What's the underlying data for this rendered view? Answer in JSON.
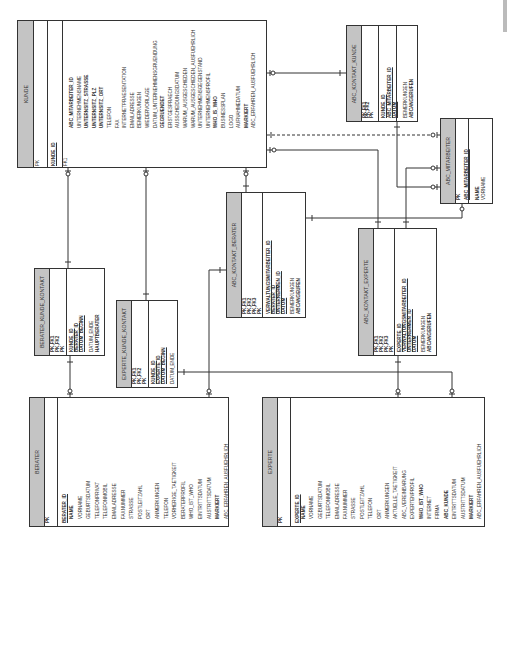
{
  "diagram": {
    "type": "entity-relationship",
    "orientation": "rotated-90-ccw"
  },
  "entities": {
    "kunde": {
      "name": "KUNDE",
      "keys": [
        "PK",
        "FK1"
      ],
      "pk": [
        "KUNDE_ID"
      ],
      "attributes": [
        {
          "label": "ABC_MITARBEITER_ID",
          "bold": true
        },
        {
          "label": "UNTERNEHMENSNAME",
          "bold": false
        },
        {
          "label": "UNTERNSITZ_STRASSE",
          "bold": true
        },
        {
          "label": "UNTERNSITZ_PLZ",
          "bold": true
        },
        {
          "label": "UNTERNSITZ_ORT",
          "bold": true
        },
        {
          "label": "TELEFON",
          "bold": false
        },
        {
          "label": "FAX",
          "bold": false
        },
        {
          "label": "INTERNETPRAESENTATION",
          "bold": false
        },
        {
          "label": "EMAILADRESSE",
          "bold": false
        },
        {
          "label": "BEMERKUNGEN",
          "bold": false
        },
        {
          "label": "WIEDERVORLAGE",
          "bold": false
        },
        {
          "label": "DATUM_UNTERNEHMENSGRUENDUNG",
          "bold": false
        },
        {
          "label": "GEGRUENDET",
          "bold": true
        },
        {
          "label": "ERSTGESPRAECH",
          "bold": false
        },
        {
          "label": "AUSSCHEIDUNGSDATUM",
          "bold": false
        },
        {
          "label": "WARUM_AUSGESCHIEDEN",
          "bold": false
        },
        {
          "label": "WARUM_AUSGESCHIEDEN_AUSFUEHRLICH",
          "bold": false
        },
        {
          "label": "UNTERNEHMENSGEGENSTAND",
          "bold": false
        },
        {
          "label": "UNTERNEHMENSPROFIL",
          "bold": false
        },
        {
          "label": "WHO_IS_WHO",
          "bold": true
        },
        {
          "label": "BUSINESSPLAN",
          "bold": false
        },
        {
          "label": "LOGO",
          "bold": false
        },
        {
          "label": "AUFNAHMEDATUM",
          "bold": false
        },
        {
          "label": "MARKIERT",
          "bold": true
        },
        {
          "label": "ABC_ERFAHREN_AUSFUEHRLICH",
          "bold": false
        }
      ]
    },
    "abc_kontakt_kunde": {
      "name": "ABC_KONTAKT_KUNDE",
      "keys": [
        "PK,FK1",
        "PK,FK2",
        "PK"
      ],
      "pk": [
        "KUNDE_ID",
        "ABC_MITARBEITER_ID",
        "DATUM"
      ],
      "attributes": [
        {
          "label": "BEMERKUNGEN",
          "bold": false
        },
        {
          "label": "ABCANGERUFEN",
          "bold": true
        }
      ]
    },
    "abc_mitarbeiter": {
      "name": "ABC_MITARBEITER",
      "keys": [
        "PK"
      ],
      "pk": [
        "ABC_MITARBEITER_ID"
      ],
      "attributes": [
        {
          "label": "NAME",
          "bold": true
        },
        {
          "label": "VORNAME",
          "bold": false
        }
      ]
    },
    "abc_kontakt_berater": {
      "name": "ABC_KONTAKT_BERATER",
      "keys": [
        "PK,FK1",
        "PK,FK2",
        "PK,FK3",
        "PK"
      ],
      "pk": [
        "VERWALTUNGSMITARBEITER_ID",
        "BERATER_ID",
        "UNTERNEHMEN_ID",
        "DATUM"
      ],
      "attributes": [
        {
          "label": "BEMERKUNGEN",
          "bold": false
        },
        {
          "label": "ABCANGEUFEN",
          "bold": true
        }
      ]
    },
    "abc_kontakt_experte": {
      "name": "ABC_KONTAKT_EXPERTE",
      "keys": [
        "PK,FK1",
        "PK,FK2",
        "PK,FK3",
        "PK"
      ],
      "pk": [
        "EXPERTE_ID",
        "VERWALTUNGSMITARBEITER_ID",
        "UNTERNEHMEN_ID",
        "DATUM"
      ],
      "attributes": [
        {
          "label": "BEMERKUNGEN",
          "bold": false
        },
        {
          "label": "ABCANGERUFEN",
          "bold": true
        }
      ]
    },
    "berater_kunde_kontakt": {
      "name": "BERATER_KUNDE_KONTAKT",
      "keys": [
        "PK,FK1",
        "PK,FK2",
        "PK"
      ],
      "pk": [
        "KUNDE_ID",
        "BERATER_ID",
        "DATUM_BEGINN"
      ],
      "attributes": [
        {
          "label": "DATUM_ENDE",
          "bold": false
        },
        {
          "label": "HAUPTBERATER",
          "bold": true
        }
      ]
    },
    "experte_kunde_kontakt": {
      "name": "EXPERTE_KUNDE_KONTAKT",
      "keys": [
        "PK,FK1",
        "PK,FK2",
        "PK"
      ],
      "pk": [
        "KUNDE_ID",
        "EXPERTE_ID",
        "DATUM_BEGINN"
      ],
      "attributes": [
        {
          "label": "DATUM_ENDE",
          "bold": false
        }
      ]
    },
    "berater": {
      "name": "BERATER",
      "keys": [
        "PK"
      ],
      "pk": [
        "BERATER_ID"
      ],
      "attributes": [
        {
          "label": "NAME",
          "bold": true
        },
        {
          "label": "VORNAME",
          "bold": false
        },
        {
          "label": "GEBURTSDATUM",
          "bold": false
        },
        {
          "label": "TELEFONPRIVAT",
          "bold": false
        },
        {
          "label": "TELEFONMOBIL",
          "bold": false
        },
        {
          "label": "EMAILADRESSE",
          "bold": false
        },
        {
          "label": "FAXNUMMER",
          "bold": false
        },
        {
          "label": "STRASSE",
          "bold": false
        },
        {
          "label": "POSTLEITZAHL",
          "bold": false
        },
        {
          "label": "ORT",
          "bold": false
        },
        {
          "label": "ANMERKUNGEN",
          "bold": false
        },
        {
          "label": "TELEFON",
          "bold": false
        },
        {
          "label": "VORHERIGE_TAETIGKEIT",
          "bold": false
        },
        {
          "label": "BERATERPROFIL",
          "bold": false
        },
        {
          "label": "WHO_IST_WHO",
          "bold": false
        },
        {
          "label": "EINTRITTSDATUM",
          "bold": false
        },
        {
          "label": "AUSTRITTSDATUM",
          "bold": false
        },
        {
          "label": "MARKIERT",
          "bold": true
        },
        {
          "label": "ABC_ERFAHREN_AUSFUEHRLICH",
          "bold": false
        }
      ]
    },
    "experte": {
      "name": "EXPERTE",
      "keys": [
        "PK"
      ],
      "pk": [
        "EXPERTE_ID"
      ],
      "attributes": [
        {
          "label": "NAME",
          "bold": true
        },
        {
          "label": "VORNAME",
          "bold": false
        },
        {
          "label": "GEBURTSDATUM",
          "bold": false
        },
        {
          "label": "TELEFONMOBIL",
          "bold": false
        },
        {
          "label": "EMAILADRESSE",
          "bold": false
        },
        {
          "label": "FAXNUMMER",
          "bold": false
        },
        {
          "label": "STRASSE",
          "bold": false
        },
        {
          "label": "POSTLEITZAHL",
          "bold": false
        },
        {
          "label": "TELEFON",
          "bold": false
        },
        {
          "label": "ORT",
          "bold": false
        },
        {
          "label": "ANMERKUNGEN",
          "bold": false
        },
        {
          "label": "AKTUELLE_TAETIGKEIT",
          "bold": false
        },
        {
          "label": "ABC_VEREINBARUNG",
          "bold": false
        },
        {
          "label": "EXPERTENPROFIL",
          "bold": false
        },
        {
          "label": "WHO_IST_WHO",
          "bold": true
        },
        {
          "label": "INTERNET",
          "bold": false
        },
        {
          "label": "FIRMA",
          "bold": false
        },
        {
          "label": "ABC_KUNDE",
          "bold": true
        },
        {
          "label": "EINTRITTSDATUM",
          "bold": false
        },
        {
          "label": "AUSTRITTSDATUM",
          "bold": false
        },
        {
          "label": "MARKIERT",
          "bold": true
        },
        {
          "label": "ABC_ERFAHREN_AUSFUEHRLICH",
          "bold": false
        }
      ]
    }
  },
  "relationships": [
    {
      "from": "KUNDE",
      "to": "ABC_KONTAKT_KUNDE",
      "style": "solid"
    },
    {
      "from": "ABC_MITARBEITER",
      "to": "KUNDE",
      "style": "dashed"
    },
    {
      "from": "KUNDE",
      "to": "ABC_KONTAKT_EXPERTE",
      "style": "solid"
    },
    {
      "from": "KUNDE",
      "to": "BERATER_KUNDE_KONTAKT",
      "style": "solid"
    },
    {
      "from": "KUNDE",
      "to": "EXPERTE_KUNDE_KONTAKT",
      "style": "solid"
    },
    {
      "from": "KUNDE",
      "to": "ABC_KONTAKT_BERATER",
      "style": "solid"
    },
    {
      "from": "ABC_MITARBEITER",
      "to": "ABC_KONTAKT_KUNDE",
      "style": "solid"
    },
    {
      "from": "ABC_MITARBEITER",
      "to": "ABC_KONTAKT_EXPERTE",
      "style": "solid"
    },
    {
      "from": "ABC_MITARBEITER",
      "to": "ABC_KONTAKT_BERATER",
      "style": "solid"
    },
    {
      "from": "BERATER",
      "to": "BERATER_KUNDE_KONTAKT",
      "style": "solid"
    },
    {
      "from": "BERATER",
      "to": "ABC_KONTAKT_BERATER",
      "style": "solid"
    },
    {
      "from": "EXPERTE",
      "to": "EXPERTE_KUNDE_KONTAKT",
      "style": "solid"
    },
    {
      "from": "EXPERTE",
      "to": "ABC_KONTAKT_EXPERTE",
      "style": "solid"
    }
  ],
  "colors": {
    "header_fill": "#c4c4c4",
    "line": "#333333",
    "background": "#ffffff"
  }
}
